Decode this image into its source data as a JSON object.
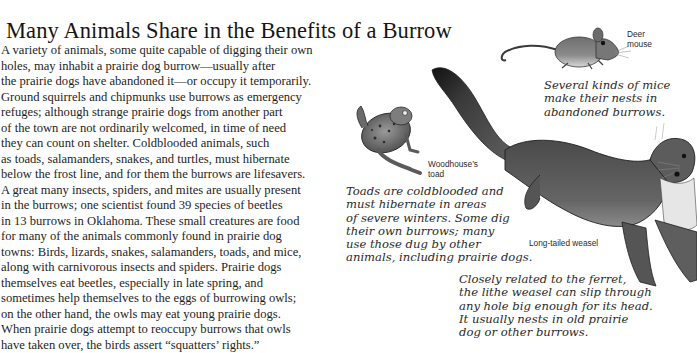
{
  "page": {
    "title": "Many Animals Share in the Benefits of a Burrow",
    "body_lines": [
      "A variety of animals, some quite capable of digging their own",
      "holes, may inhabit a prairie dog burrow—usually after",
      "the prairie dogs have abandoned it—or occupy it temporarily.",
      "Ground squirrels and chipmunks use burrows as emergency",
      "refuges; although strange prairie dogs from another part",
      "of the town are not ordinarily welcomed, in time of need",
      "they can count on shelter. Coldblooded animals, such",
      "as toads, salamanders, snakes, and turtles, must hibernate",
      "below the frost line, and for them the burrows are lifesavers.",
      "A great many insects, spiders, and mites are usually present",
      "in the burrows; one scientist found 39 species of beetles",
      "in 13 burrows in Oklahoma. These small creatures are food",
      "for many of the animals commonly found in prairie dog",
      "towns: Birds, lizards, snakes, salamanders, toads, and mice,",
      "along with carnivorous insects and spiders. Prairie dogs",
      "themselves eat beetles, especially in late spring, and",
      "sometimes help themselves to the eggs of burrowing owls;",
      "on the other hand, the owls may eat young prairie dogs.",
      "When prairie dogs attempt to reoccupy burrows that owls",
      "have taken over, the birds assert “squatters’ rights.”"
    ]
  },
  "illustrations": {
    "mouse": {
      "label_lines": [
        "Deer",
        "mouse"
      ],
      "caption_lines": [
        "Several kinds of mice",
        "make their nests in",
        "abandoned burrows."
      ]
    },
    "toad": {
      "label_lines": [
        "Woodhouse’s",
        "toad"
      ],
      "caption_lines": [
        "Toads are coldblooded and",
        "must hibernate in areas",
        "of severe winters. Some dig",
        "their own burrows; many",
        "use those dug by other",
        "animals, including prairie dogs."
      ]
    },
    "weasel": {
      "label": "Long-tailed weasel",
      "caption_lines": [
        "Closely related to the ferret,",
        "the lithe weasel can slip through",
        "any hole big enough for its head.",
        "It usually nests in old prairie",
        "dog or other burrows."
      ]
    }
  }
}
